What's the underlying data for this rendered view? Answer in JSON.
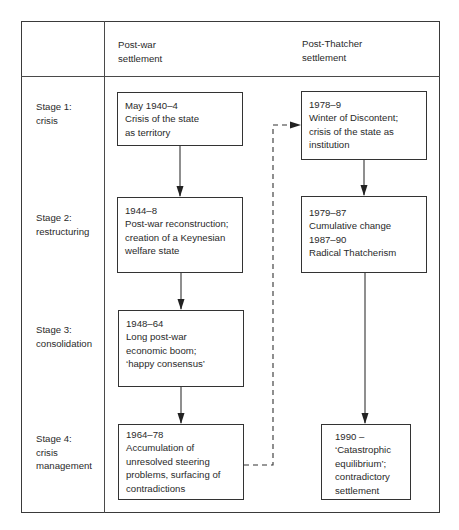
{
  "diagram": {
    "columns": {
      "stage_header": "",
      "post_war": "Post-war\nsettlement",
      "post_thatcher": "Post-Thatcher\nsettlement"
    },
    "stages": [
      {
        "label": "Stage 1:\ncrisis"
      },
      {
        "label": "Stage 2:\nrestructuring"
      },
      {
        "label": "Stage 3:\nconsolidation"
      },
      {
        "label": "Stage 4:\ncrisis\nmanagement"
      }
    ],
    "post_war_boxes": [
      {
        "lines": [
          "May 1940–4",
          "Crisis of the state",
          "as territory"
        ]
      },
      {
        "lines": [
          "1944–8",
          "Post-war reconstruction;",
          "creation of a Keynesian",
          "welfare state"
        ]
      },
      {
        "lines": [
          "1948–64",
          "Long post-war",
          "economic boom;",
          "‘happy consensus’"
        ]
      },
      {
        "lines": [
          "1964–78",
          "Accumulation of",
          "unresolved steering",
          "problems, surfacing of",
          "contradictions"
        ]
      }
    ],
    "post_thatcher_boxes": [
      {
        "lines": [
          "1978–9",
          "Winter of Discontent;",
          "crisis of the state as",
          "institution"
        ]
      },
      {
        "lines": [
          "1979–87",
          "Cumulative change",
          "1987–90",
          "Radical Thatcherism"
        ]
      },
      {
        "lines": [
          "1990 –",
          "‘Catastrophic",
          "equilibrium’;",
          "contradictory",
          "settlement"
        ]
      }
    ],
    "connectors": {
      "solid_arrows": "downward flow within each settlement column",
      "dashed_arrow": "from 1964–78 box to 1978–9 box"
    },
    "colors": {
      "line": "#333333",
      "text": "#2a2a2a",
      "background": "#ffffff"
    }
  }
}
